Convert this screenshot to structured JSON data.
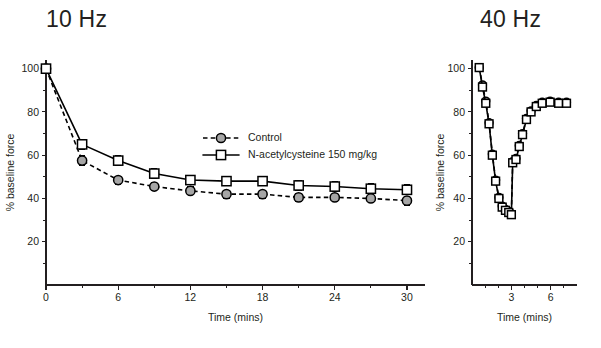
{
  "figure": {
    "panels": [
      {
        "id": "left",
        "title": "10 Hz",
        "ylabel": "% baseline force",
        "xlabel": "Time (mins)"
      },
      {
        "id": "right",
        "title": "40 Hz",
        "ylabel": "% baseline force",
        "xlabel": "Time (mins)"
      }
    ],
    "legend": {
      "entries": [
        {
          "label": "Control",
          "marker": "filled-grey-circle",
          "line": "dashed",
          "color": "#a6a6a6"
        },
        {
          "label": "N-acetylcysteine 150 mg/kg",
          "marker": "open-square",
          "line": "solid",
          "color": "#ffffff"
        }
      ]
    }
  },
  "chart_data": [
    {
      "type": "line",
      "title": "10 Hz",
      "xlabel": "Time (mins)",
      "ylabel": "% baseline force",
      "xlim": [
        0,
        31.5
      ],
      "ylim": [
        0,
        104
      ],
      "xticks": [
        0,
        6,
        12,
        18,
        24,
        30
      ],
      "xticks_minor": [
        3,
        9,
        15,
        21,
        27
      ],
      "yticks": [
        20,
        40,
        60,
        80,
        100
      ],
      "yticks_minor": [
        10,
        30,
        50,
        70,
        90
      ],
      "grid": false,
      "legend_position": "upper-right-inside",
      "x": [
        0,
        3,
        6,
        9,
        12,
        15,
        18,
        21,
        24,
        27,
        30
      ],
      "series": [
        {
          "name": "Control",
          "values": [
            100,
            57.5,
            48.5,
            45.5,
            43.5,
            42,
            42,
            40.5,
            40.5,
            40,
            39
          ],
          "errors": [
            0,
            2.2,
            1.8,
            1.8,
            1.8,
            1.8,
            1.8,
            2.0,
            2.0,
            2.0,
            2.0
          ]
        },
        {
          "name": "N-acetylcysteine 150 mg/kg",
          "values": [
            100,
            65,
            57.5,
            51.5,
            48.5,
            48,
            48,
            46,
            45.5,
            44.5,
            44
          ],
          "errors": [
            0,
            2.2,
            2.2,
            2.2,
            2.2,
            2.2,
            2.2,
            2.2,
            2.2,
            2.2,
            2.2
          ]
        }
      ]
    },
    {
      "type": "line",
      "title": "40 Hz",
      "xlabel": "Time (mins)",
      "ylabel": "% baseline force",
      "xlim": [
        0,
        8
      ],
      "ylim": [
        0,
        104
      ],
      "xticks": [
        3,
        6
      ],
      "xticks_minor": [
        1,
        2,
        4,
        5,
        7
      ],
      "yticks": [
        20,
        40,
        60,
        80,
        100
      ],
      "yticks_minor": [
        10,
        30,
        50,
        70,
        90
      ],
      "grid": false,
      "legend_position": "none",
      "x": [
        0.55,
        0.8,
        1.05,
        1.3,
        1.55,
        1.8,
        2.05,
        2.3,
        2.55,
        2.8,
        3.0,
        3.1,
        3.35,
        3.6,
        3.85,
        4.15,
        4.5,
        4.9,
        5.35,
        5.95,
        6.6,
        7.2
      ],
      "series": [
        {
          "name": "Control",
          "values": [
            100.5,
            92.5,
            85,
            75,
            60.5,
            48.5,
            40.5,
            36.5,
            35,
            34,
            33,
            57,
            58.5,
            64.5,
            70,
            77,
            80.5,
            83,
            84.5,
            85,
            84.5,
            84.5
          ],
          "errors": [
            1.2,
            1.2,
            1.2,
            1.2,
            1.2,
            1.2,
            1.2,
            1.2,
            1.2,
            1.2,
            1.2,
            1.5,
            1.2,
            1.2,
            1.2,
            1.2,
            1.2,
            1.2,
            1.2,
            1.2,
            1.2,
            1.2
          ]
        },
        {
          "name": "N-acetylcysteine 150 mg/kg",
          "values": [
            100.5,
            91.5,
            84,
            74.5,
            60,
            48,
            40,
            36,
            34.5,
            33.5,
            32.5,
            56.5,
            58,
            64,
            69.5,
            76.5,
            80,
            82.5,
            84,
            84.5,
            84,
            84
          ],
          "errors": [
            1.2,
            1.2,
            1.2,
            1.2,
            1.2,
            1.2,
            1.2,
            1.2,
            1.2,
            1.2,
            1.2,
            1.5,
            1.2,
            1.2,
            1.2,
            1.2,
            1.2,
            1.2,
            1.2,
            1.2,
            1.2,
            1.2
          ]
        }
      ]
    }
  ]
}
